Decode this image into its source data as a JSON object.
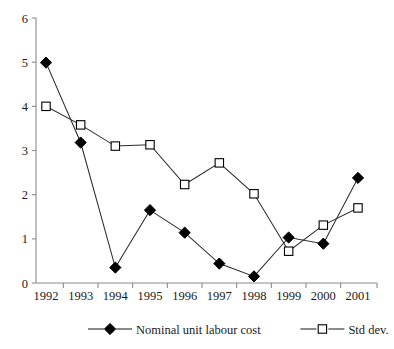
{
  "chart_data": {
    "type": "line",
    "title": "",
    "subtitle": "",
    "xlabel": "",
    "ylabel": "",
    "categories": [
      "1992",
      "1993",
      "1994",
      "1995",
      "1996",
      "1997",
      "1998",
      "1999",
      "2000",
      "2001"
    ],
    "series": [
      {
        "name": "Nominal unit labour cost",
        "marker": "filled-diamond",
        "values": [
          4.99,
          3.18,
          0.35,
          1.65,
          1.14,
          0.44,
          0.15,
          1.03,
          0.89,
          2.38
        ]
      },
      {
        "name": "Std dev.",
        "marker": "open-square",
        "values": [
          4.0,
          3.58,
          3.1,
          3.13,
          2.23,
          2.72,
          2.02,
          0.72,
          1.31,
          1.7
        ]
      }
    ],
    "ylim": [
      0,
      6
    ],
    "y_ticks": [
      0,
      1,
      2,
      3,
      4,
      5,
      6
    ],
    "y_tick_labels": [
      "0",
      "1",
      "2",
      "3",
      "4",
      "5",
      "6"
    ],
    "grid": false,
    "legend_position": "bottom"
  },
  "legend": {
    "entries": [
      {
        "label": "Nominal unit labour cost",
        "marker": "filled-diamond"
      },
      {
        "label": "Std dev.",
        "marker": "open-square"
      }
    ]
  },
  "colors": {
    "series_line": "#2b2b2b",
    "axis": "#8a8a8a",
    "marker_fill": "#000000",
    "marker_open_fill": "#ffffff",
    "text": "#1a1a1a",
    "background": "#ffffff"
  }
}
